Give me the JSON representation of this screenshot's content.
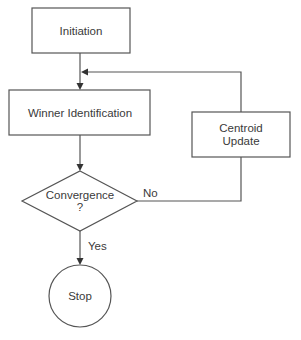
{
  "diagram": {
    "type": "flowchart",
    "nodes": {
      "initiation": {
        "label": "Initiation",
        "shape": "rectangle"
      },
      "winner": {
        "label": "Winner Identification",
        "shape": "rectangle"
      },
      "centroid": {
        "label_line1": "Centroid",
        "label_line2": "Update",
        "shape": "rectangle"
      },
      "convergence": {
        "label_line1": "Convergence",
        "label_line2": "?",
        "shape": "diamond"
      },
      "stop": {
        "label": "Stop",
        "shape": "circle"
      }
    },
    "edges": [
      {
        "from": "initiation",
        "to": "winner",
        "label": ""
      },
      {
        "from": "winner",
        "to": "convergence",
        "label": ""
      },
      {
        "from": "convergence",
        "to": "stop",
        "label": "Yes"
      },
      {
        "from": "convergence",
        "to": "centroid",
        "label": "No"
      },
      {
        "from": "centroid",
        "to": "winner",
        "label": ""
      }
    ],
    "edge_labels": {
      "yes": "Yes",
      "no": "No"
    },
    "colors": {
      "stroke": "#555555",
      "text": "#3a3a3a",
      "background": "#ffffff"
    }
  }
}
